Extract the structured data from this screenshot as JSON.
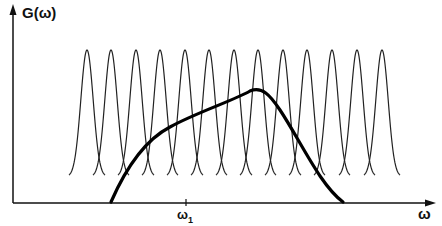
{
  "figure": {
    "y_axis_label": "G(ω)",
    "x_axis_label": "ω",
    "tick_label": "ω",
    "tick_subscript": "1",
    "colors": {
      "ink": "#111111",
      "background": "#ffffff"
    }
  },
  "diagram": {
    "narrow_peaks": {
      "count": 13,
      "centers_px": [
        87,
        111,
        136,
        160,
        185,
        209,
        234,
        258,
        283,
        307,
        332,
        357,
        382
      ],
      "peak_y_px": 50,
      "base_y_px": 177
    },
    "broad_curve": {
      "start_px": [
        111,
        202
      ],
      "knee_px": [
        170,
        127
      ],
      "peak_px": [
        254,
        90
      ],
      "end_px": [
        343,
        202
      ]
    },
    "tick_x_px": 186
  }
}
